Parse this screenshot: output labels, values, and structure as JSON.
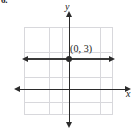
{
  "problem": {
    "number": "6."
  },
  "graph": {
    "point_label": "(0, 3)",
    "x_axis_label": "x",
    "y_axis_label": "y",
    "colors": {
      "grid": "#d8d8dc",
      "axis": "#2b2b2b",
      "plot_line": "#3a3a3a",
      "text": "#1a1a1a",
      "background": "#ffffff"
    }
  },
  "chart_data": {
    "type": "line",
    "title": "",
    "xlabel": "x",
    "ylabel": "y",
    "xlim": [
      -3.5,
      3.5
    ],
    "ylim": [
      -3.5,
      3.5
    ],
    "grid": true,
    "grid_columns": 7,
    "grid_rows": 7,
    "legend": null,
    "tick_labels": {
      "x": [],
      "y": []
    },
    "series": [
      {
        "name": "y = 3",
        "type": "horizontal-line",
        "y_value": 3,
        "x_range": [
          -3.5,
          3.5
        ],
        "arrows_both_ends": true
      }
    ],
    "points": [
      {
        "x": 0,
        "y": 3,
        "label": "(0, 3)"
      }
    ],
    "annotations": [
      {
        "text": "(0, 3)",
        "x": 0.3,
        "y": 3.5
      }
    ]
  }
}
